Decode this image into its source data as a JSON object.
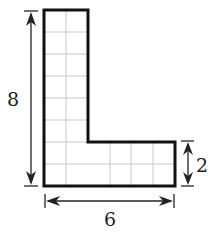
{
  "figure": {
    "shape": "L-shape on unit grid",
    "grid": {
      "columns": 6,
      "rows": 8,
      "cell_px": 21.9
    },
    "vertical_stem_width_units": 2,
    "foot_height_units": 2,
    "colors": {
      "outline": "#111111",
      "grid": "#c8c8c8",
      "dimension": "#222222"
    }
  },
  "dimensions": {
    "height_label": "8",
    "width_label": "6",
    "foot_height_label": "2"
  }
}
